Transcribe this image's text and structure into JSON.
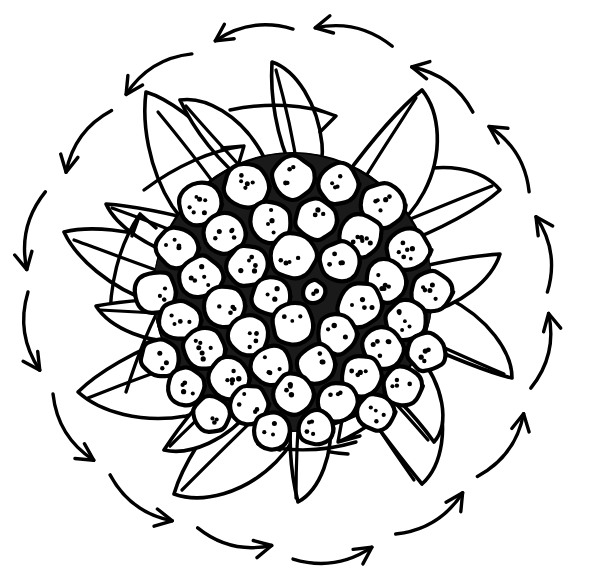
{
  "figure": {
    "medium": "black ink on white paper",
    "background_color": "#ffffff",
    "ink_color": "#000000",
    "canvas": {
      "width": 591,
      "height": 588
    },
    "center": {
      "x": 293,
      "y": 292
    }
  },
  "disc": {
    "name": "seed-head",
    "radius": 135,
    "floret_count": 54,
    "interstitial_texture": "dense stipple",
    "florets": [
      {
        "x": 293,
        "y": 178,
        "r": 22,
        "dots": 4
      },
      {
        "x": 246,
        "y": 186,
        "r": 23,
        "dots": 5
      },
      {
        "x": 338,
        "y": 184,
        "r": 21,
        "dots": 4
      },
      {
        "x": 200,
        "y": 204,
        "r": 22,
        "dots": 6
      },
      {
        "x": 383,
        "y": 205,
        "r": 23,
        "dots": 5
      },
      {
        "x": 270,
        "y": 222,
        "r": 22,
        "dots": 4
      },
      {
        "x": 316,
        "y": 220,
        "r": 21,
        "dots": 3
      },
      {
        "x": 224,
        "y": 233,
        "r": 22,
        "dots": 5
      },
      {
        "x": 361,
        "y": 236,
        "r": 22,
        "dots": 6
      },
      {
        "x": 177,
        "y": 248,
        "r": 21,
        "dots": 4
      },
      {
        "x": 408,
        "y": 250,
        "r": 22,
        "dots": 6
      },
      {
        "x": 293,
        "y": 256,
        "r": 24,
        "dots": 4
      },
      {
        "x": 247,
        "y": 266,
        "r": 21,
        "dots": 5
      },
      {
        "x": 340,
        "y": 262,
        "r": 21,
        "dots": 4
      },
      {
        "x": 201,
        "y": 277,
        "r": 22,
        "dots": 5
      },
      {
        "x": 386,
        "y": 281,
        "r": 22,
        "dots": 5
      },
      {
        "x": 156,
        "y": 292,
        "r": 22,
        "dots": 4
      },
      {
        "x": 431,
        "y": 292,
        "r": 21,
        "dots": 5
      },
      {
        "x": 271,
        "y": 296,
        "r": 20,
        "dots": 3
      },
      {
        "x": 314,
        "y": 292,
        "r": 12,
        "dots": 2
      },
      {
        "x": 225,
        "y": 306,
        "r": 21,
        "dots": 4
      },
      {
        "x": 360,
        "y": 305,
        "r": 23,
        "dots": 4
      },
      {
        "x": 180,
        "y": 320,
        "r": 21,
        "dots": 4
      },
      {
        "x": 406,
        "y": 320,
        "r": 21,
        "dots": 5
      },
      {
        "x": 293,
        "y": 324,
        "r": 22,
        "dots": 3
      },
      {
        "x": 249,
        "y": 336,
        "r": 21,
        "dots": 4
      },
      {
        "x": 337,
        "y": 334,
        "r": 21,
        "dots": 3
      },
      {
        "x": 204,
        "y": 349,
        "r": 22,
        "dots": 6
      },
      {
        "x": 383,
        "y": 348,
        "r": 21,
        "dots": 5
      },
      {
        "x": 160,
        "y": 358,
        "r": 20,
        "dots": 3
      },
      {
        "x": 427,
        "y": 352,
        "r": 20,
        "dots": 4
      },
      {
        "x": 272,
        "y": 366,
        "r": 21,
        "dots": 4
      },
      {
        "x": 317,
        "y": 364,
        "r": 20,
        "dots": 3
      },
      {
        "x": 228,
        "y": 378,
        "r": 21,
        "dots": 5
      },
      {
        "x": 361,
        "y": 376,
        "r": 21,
        "dots": 4
      },
      {
        "x": 186,
        "y": 386,
        "r": 19,
        "dots": 4
      },
      {
        "x": 402,
        "y": 386,
        "r": 20,
        "dots": 4
      },
      {
        "x": 293,
        "y": 394,
        "r": 21,
        "dots": 4
      },
      {
        "x": 249,
        "y": 404,
        "r": 20,
        "dots": 4
      },
      {
        "x": 338,
        "y": 402,
        "r": 20,
        "dots": 3
      },
      {
        "x": 212,
        "y": 414,
        "r": 19,
        "dots": 3
      },
      {
        "x": 376,
        "y": 412,
        "r": 19,
        "dots": 4
      },
      {
        "x": 272,
        "y": 430,
        "r": 19,
        "dots": 3
      },
      {
        "x": 316,
        "y": 428,
        "r": 18,
        "dots": 4
      }
    ]
  },
  "bracts": {
    "name": "petal-ring",
    "count": 16,
    "inner_ring_count": 8,
    "outer_ring_count": 8,
    "arrow_note": "each bract carries one internal arrow indicating its growth vector"
  },
  "flow_arrows": {
    "name": "rotational-flow-ring",
    "count": 16,
    "direction": "counterclockwise",
    "radius": 265,
    "segments": [
      {
        "angle": 270,
        "label": "top-center"
      },
      {
        "angle": 292,
        "label": "top-left"
      },
      {
        "angle": 315,
        "label": "upper-left"
      },
      {
        "angle": 337,
        "label": "left-upper"
      },
      {
        "angle": 0,
        "label": "left"
      },
      {
        "angle": 22,
        "label": "left-lower"
      },
      {
        "angle": 45,
        "label": "lower-left"
      },
      {
        "angle": 67,
        "label": "bottom-left"
      },
      {
        "angle": 90,
        "label": "bottom-center"
      },
      {
        "angle": 112,
        "label": "bottom-right"
      },
      {
        "angle": 135,
        "label": "lower-right"
      },
      {
        "angle": 157,
        "label": "right-lower"
      },
      {
        "angle": 180,
        "label": "right"
      },
      {
        "angle": 202,
        "label": "right-upper"
      },
      {
        "angle": 225,
        "label": "upper-right"
      },
      {
        "angle": 247,
        "label": "top-right"
      }
    ]
  }
}
